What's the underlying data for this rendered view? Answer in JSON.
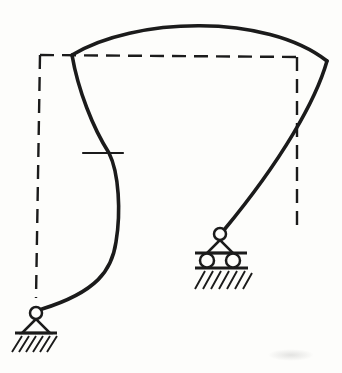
{
  "figure": {
    "type": "structural-mechanics-diagram",
    "labels": [],
    "colors": {
      "line": "#1b1b1b",
      "background": "#fdfdfb"
    }
  },
  "undeformed": {
    "style": "dashed-outline",
    "left_column_d": "M40,55 L36,298",
    "beam_d": "M40,55 L297,57",
    "right_column_d": "M297,57 L297,232"
  },
  "deflected": {
    "style": "solid-curves",
    "left_column_d": "M72,55 C78,90 93,128 109,153 C119,173 121,212 116,242 C112,270 97,292 42,309",
    "beam_d": "M72,55 C134,17 266,13 327,61",
    "right_column_d": "M327,61 C316,100 282,160 224,230"
  },
  "inflection_tick_d": "M83,153 L123,153",
  "supports": {
    "pin": {
      "kind": "hinged-pin-support",
      "hinge_circle_d": "M30,313 a6,6 0 1 0 12,0 a6,6 0 1 0 -12,0",
      "triangle_d": "M36,319 L22,333 L50,333 Z",
      "ground_line_d": "M15,333 L57,333",
      "hatch_d": "M12,352 L22,336 M19,352 L29,336 M26,352 L36,336 M33,352 L43,336 M40,352 L50,336 M47,352 L57,336"
    },
    "roller": {
      "kind": "roller-support",
      "hinge_circle_d": "M214,234 a6,6 0 1 0 12,0 a6,6 0 1 0 -12,0",
      "triangle_d": "M220,240 L207,253 L233,253 Z",
      "upper_ground_line_d": "M195,253 L247,253",
      "rollers_d": "M200,260.5 a7,7 0 1 0 14,0 a7,7 0 1 0 -14,0 M226,260.5 a7,7 0 1 0 14,0 a7,7 0 1 0 -14,0",
      "lower_ground_line_d": "M195,268 L248,268",
      "hatch_d": "M195,289 L205,271 M203,289 L213,271 M211,289 L221,271 M219,289 L229,271 M227,289 L237,271 M235,289 L245,271 M243,289 L252,273"
    }
  }
}
